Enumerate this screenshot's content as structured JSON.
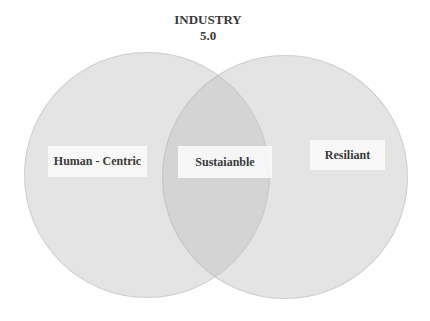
{
  "diagram": {
    "type": "venn",
    "title_line1": "INDUSTRY",
    "title_line2": "5.0",
    "sets": [
      {
        "id": "left",
        "label": "Human - Centric"
      },
      {
        "id": "right",
        "label": "Resiliant"
      }
    ],
    "intersection_label": "Sustaianble",
    "colors": {
      "circle_fill": "#e4e4e4",
      "overlap_fill": "#cacaca",
      "label_box_fill": "#f8f8f8",
      "text": "#3a3a3a",
      "background": "#ffffff"
    }
  }
}
